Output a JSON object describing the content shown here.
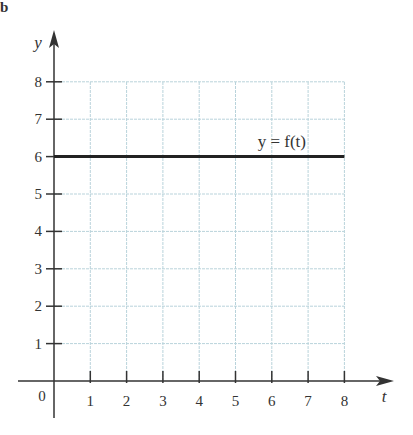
{
  "chart_data": {
    "type": "line",
    "title": "",
    "xlabel": "t",
    "ylabel": "y",
    "xlim": [
      0,
      8
    ],
    "ylim": [
      0,
      8
    ],
    "grid": true,
    "x_ticks": [
      "1",
      "2",
      "3",
      "4",
      "5",
      "6",
      "7",
      "8"
    ],
    "y_ticks": [
      "1",
      "2",
      "3",
      "4",
      "5",
      "6",
      "7",
      "8"
    ],
    "origin_label": "0",
    "series": [
      {
        "name": "y = f(t)",
        "x": [
          0,
          8
        ],
        "values": [
          6,
          6
        ]
      }
    ],
    "annotations": [
      {
        "text": "y = f(t)",
        "x": 6,
        "y": 6.3
      }
    ]
  },
  "corner_mark": "b",
  "colors": {
    "axis": "#333333",
    "grid": "#b9d3db",
    "line": "#222222"
  }
}
